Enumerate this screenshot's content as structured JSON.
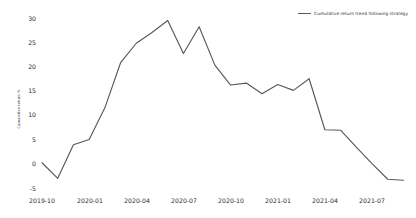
{
  "chart_data": {
    "type": "line",
    "title": "",
    "xlabel": "",
    "ylabel": "Cumulative return %",
    "ylim": [
      -5,
      30
    ],
    "xlim": [
      "2019-10",
      "2021-09"
    ],
    "grid": false,
    "legend_position": "top-right",
    "line_color": "#555a5e",
    "background_color": "#ffffff",
    "yticks": [
      "30",
      "25",
      "20",
      "15",
      "10",
      "5",
      "0",
      "-5"
    ],
    "ytick_values": [
      30,
      25,
      20,
      15,
      10,
      5,
      0,
      -5
    ],
    "xticks": [
      "2019-10",
      "2020-01",
      "2020-04",
      "2020-07",
      "2020-10",
      "2021-01",
      "2021-04",
      "2021-07"
    ],
    "xtick_values": [
      "2019-10",
      "2020-01",
      "2020-04",
      "2020-07",
      "2020-10",
      "2021-01",
      "2021-04",
      "2021-07"
    ],
    "series": [
      {
        "name": "Cumulative return trend following strategy",
        "x": [
          "2019-10",
          "2019-11",
          "2019-12",
          "2020-01",
          "2020-02",
          "2020-03",
          "2020-04",
          "2020-05",
          "2020-06",
          "2020-07",
          "2020-08",
          "2020-09",
          "2020-10",
          "2020-11",
          "2020-12",
          "2021-01",
          "2021-02",
          "2021-03",
          "2021-04",
          "2021-05",
          "2021-06",
          "2021-07",
          "2021-08",
          "2021-09"
        ],
        "values": [
          0.2,
          -3.0,
          3.9,
          5.0,
          11.5,
          20.8,
          24.8,
          27.0,
          29.5,
          22.7,
          28.2,
          20.3,
          16.2,
          16.6,
          14.4,
          16.3,
          15.1,
          17.5,
          7.0,
          6.9,
          3.4,
          0.0,
          -3.2,
          -3.4
        ]
      }
    ]
  },
  "legend": {
    "entries": [
      {
        "label": "Cumulative return trend following strategy",
        "color": "#555a5e"
      }
    ]
  }
}
